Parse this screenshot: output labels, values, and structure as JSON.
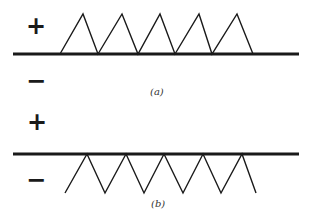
{
  "colors": {
    "line": "#1a1a1a",
    "background": "#ffffff"
  },
  "panel_a": {
    "caption": "(a)",
    "plus_label": "+",
    "minus_label": "−",
    "description": "Triangular wave above the surface line (positive side)",
    "surface_line": {
      "x1": 13,
      "x2": 299,
      "y": 54
    },
    "wave_points": [
      [
        60,
        54
      ],
      [
        83,
        14
      ],
      [
        98,
        54
      ],
      [
        122,
        14
      ],
      [
        138,
        54
      ],
      [
        160,
        14
      ],
      [
        175,
        54
      ],
      [
        199,
        14
      ],
      [
        212,
        54
      ],
      [
        237,
        14
      ],
      [
        253,
        54
      ]
    ]
  },
  "panel_b": {
    "caption": "(b)",
    "plus_label": "+",
    "minus_label": "−",
    "description": "Triangular wave below the surface line (negative side)",
    "surface_line": {
      "x1": 13,
      "x2": 299,
      "y": 154
    },
    "wave_points": [
      [
        65,
        193
      ],
      [
        87,
        154
      ],
      [
        105,
        193
      ],
      [
        126,
        154
      ],
      [
        144,
        193
      ],
      [
        164,
        154
      ],
      [
        183,
        193
      ],
      [
        203,
        154
      ],
      [
        221,
        193
      ],
      [
        242,
        154
      ],
      [
        256,
        193
      ]
    ]
  }
}
